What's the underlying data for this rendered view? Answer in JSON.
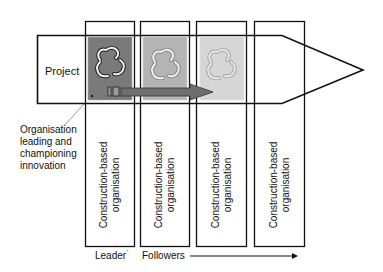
{
  "diagram": {
    "banner_label": "Project",
    "annotation": "Organisation leading and championing innovation",
    "annotation_lines": [
      "Organisation",
      "leading and",
      "championing",
      "innovation"
    ],
    "columns": [
      {
        "line1": "Construction-based",
        "line2": "organisation",
        "role": "leader",
        "icon_shade": "dark"
      },
      {
        "line1": "Construction-based",
        "line2": "organisation",
        "role": "follower",
        "icon_shade": "medium"
      },
      {
        "line1": "Construction-based",
        "line2": "organisation",
        "role": "follower",
        "icon_shade": "light"
      },
      {
        "line1": "Construction-based",
        "line2": "organisation",
        "role": "follower",
        "icon_shade": "none"
      }
    ],
    "leader_label": "Leader",
    "followers_label": "Followers",
    "icon": "recycle-innovation-icon",
    "colors": {
      "dark": "#7a7a7a",
      "medium": "#b4b4b4",
      "light": "#d6d6d6",
      "arrow": "#6e6e6e",
      "line": "#111111"
    }
  }
}
